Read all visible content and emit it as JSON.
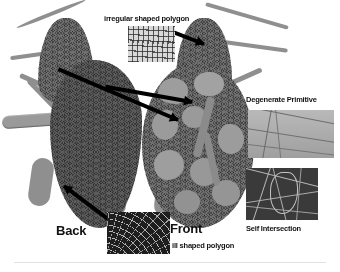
{
  "figure": {
    "type": "annotated-diagram",
    "background_color": "#ffffff",
    "accent_color": "#000000"
  },
  "views": [
    {
      "id": "back",
      "label": "Back"
    },
    {
      "id": "front",
      "label": "Front"
    }
  ],
  "annotations": [
    {
      "id": "irregular-shaped-polygon",
      "label": "irregular shaped polygon",
      "inset": "grid-mesh-closeup",
      "position": "top-center"
    },
    {
      "id": "degenerate-primitive",
      "label": "Degenerate Primitive",
      "inset": "sliver-triangle-closeup",
      "position": "right-upper"
    },
    {
      "id": "self-intersection",
      "label": "Self Intersection",
      "inset": "tangled-mesh-closeup",
      "position": "right-lower"
    },
    {
      "id": "ill-shaped-polygon",
      "label": "ill shaped polygon",
      "inset": "stretched-mesh-closeup",
      "position": "bottom-center"
    }
  ]
}
